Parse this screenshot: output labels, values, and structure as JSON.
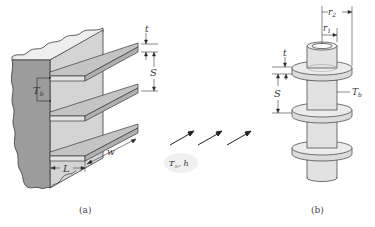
{
  "diagram": {
    "panels": [
      {
        "id": "a",
        "caption": "(a)",
        "description": "Straight rectangular fins on a plane wall",
        "labels": {
          "thickness": "t",
          "spacing": "S",
          "base_temp": "T",
          "base_temp_sub": "b",
          "width": "w",
          "length": "L"
        }
      },
      {
        "id": "b",
        "caption": "(b)",
        "description": "Annular fins on a circular tube",
        "labels": {
          "outer_radius": "r",
          "outer_radius_sub": "2",
          "inner_radius": "r",
          "inner_radius_sub": "1",
          "thickness": "t",
          "spacing": "S",
          "base_temp": "T",
          "base_temp_sub": "b"
        }
      }
    ],
    "fluid": {
      "temp_label": "T",
      "temp_sub": "∞",
      "coeff_label": ", h"
    },
    "colors": {
      "wall_side": "#9a9a9a",
      "wall_front": "#d0d0d0",
      "fin_top": "#c4c4c4",
      "fin_edge": "#e6e6e6",
      "outline": "#3a3a3a",
      "cloud": "#f0f0f0"
    }
  }
}
